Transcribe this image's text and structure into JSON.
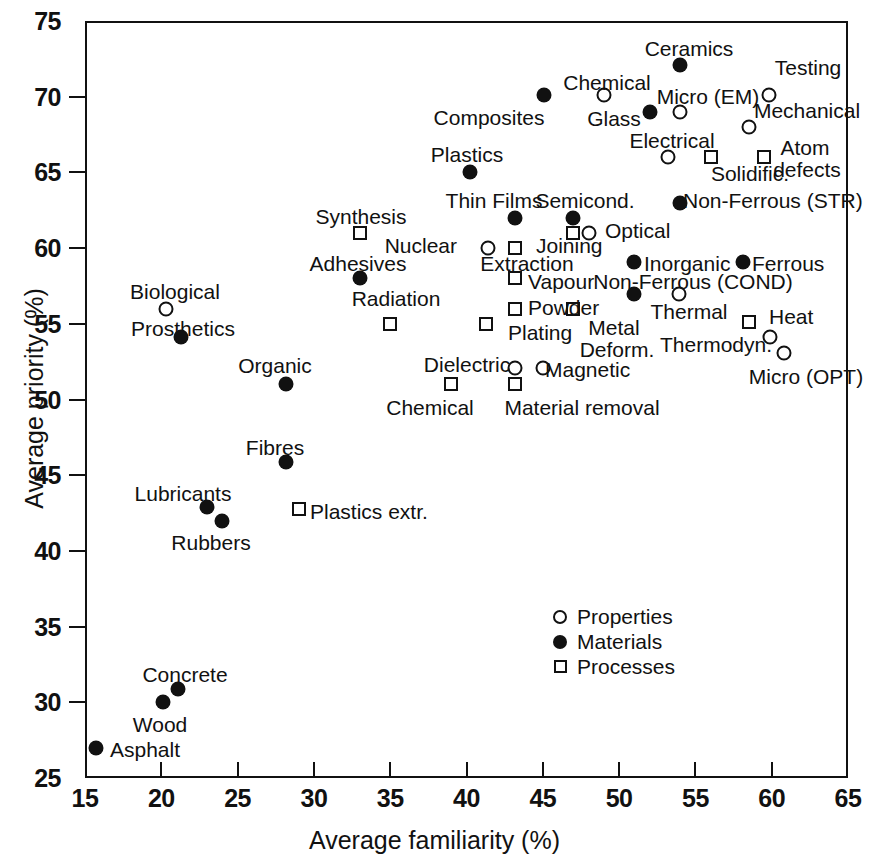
{
  "chart_data": {
    "type": "scatter",
    "title": "",
    "xlabel": "Average familiarity  (%)",
    "ylabel": "Average priority  (%)",
    "xlim": [
      15,
      65
    ],
    "ylim": [
      25,
      75
    ],
    "xticks": [
      15,
      20,
      25,
      30,
      35,
      40,
      45,
      50,
      55,
      60,
      65
    ],
    "yticks": [
      25,
      30,
      35,
      40,
      45,
      50,
      55,
      60,
      65,
      70,
      75
    ],
    "grid": false,
    "legend_position": "lower-center-right",
    "series": [
      {
        "name": "Properties",
        "marker": "open-circle",
        "points": [
          {
            "label": "Biological",
            "x": 20.3,
            "y": 56.0
          },
          {
            "label": "Chemical",
            "x": 49.0,
            "y": 70.1
          },
          {
            "label": "Micro (EM)",
            "x": 54.0,
            "y": 69.0
          },
          {
            "label": "Testing",
            "x": 59.8,
            "y": 70.1
          },
          {
            "label": "Mechanical",
            "x": 58.5,
            "y": 68.0
          },
          {
            "label": "Electrical",
            "x": 53.2,
            "y": 66.0
          },
          {
            "label": "Optical",
            "x": 48.0,
            "y": 61.0
          },
          {
            "label": "Nuclear",
            "x": 41.4,
            "y": 60.0
          },
          {
            "label": "Thermal",
            "x": 53.9,
            "y": 57.0
          },
          {
            "label": "Thermodyn.",
            "x": 59.9,
            "y": 54.1
          },
          {
            "label": "Micro (OPT)",
            "x": 60.8,
            "y": 53.1
          },
          {
            "label": "Dielectric",
            "x": 43.2,
            "y": 52.1
          },
          {
            "label": "Magnetic",
            "x": 45.0,
            "y": 52.1
          }
        ]
      },
      {
        "name": "Materials",
        "marker": "filled-circle",
        "points": [
          {
            "label": "Ceramics",
            "x": 54.0,
            "y": 72.1
          },
          {
            "label": "Composites",
            "x": 45.1,
            "y": 70.1
          },
          {
            "label": "Glass",
            "x": 52.0,
            "y": 69.0
          },
          {
            "label": "Plastics",
            "x": 40.2,
            "y": 65.0
          },
          {
            "label": "Non-Ferrous (STR)",
            "x": 54.0,
            "y": 63.0
          },
          {
            "label": "Thin Films",
            "x": 43.2,
            "y": 62.0
          },
          {
            "label": "Semicond.",
            "x": 47.0,
            "y": 62.0
          },
          {
            "label": "Inorganic",
            "x": 51.0,
            "y": 59.1
          },
          {
            "label": "Ferrous",
            "x": 58.1,
            "y": 59.1
          },
          {
            "label": "Adhesives",
            "x": 33.0,
            "y": 58.0
          },
          {
            "label": "Non-Ferrous (COND)",
            "x": 51.0,
            "y": 57.0
          },
          {
            "label": "Prosthetics",
            "x": 21.3,
            "y": 54.1
          },
          {
            "label": "Organic",
            "x": 28.2,
            "y": 51.0
          },
          {
            "label": "Fibres",
            "x": 28.2,
            "y": 45.9
          },
          {
            "label": "Lubricants",
            "x": 23.0,
            "y": 42.9
          },
          {
            "label": "Rubbers",
            "x": 24.0,
            "y": 42.0
          },
          {
            "label": "Concrete",
            "x": 21.1,
            "y": 30.9
          },
          {
            "label": "Wood",
            "x": 20.1,
            "y": 30.0
          },
          {
            "label": "Asphalt",
            "x": 15.7,
            "y": 27.0
          }
        ]
      },
      {
        "name": "Processes",
        "marker": "open-square",
        "points": [
          {
            "label": "Solidific.",
            "x": 56.0,
            "y": 66.0
          },
          {
            "label": "Atom defects",
            "x": 59.5,
            "y": 66.0
          },
          {
            "label": "Synthesis",
            "x": 33.0,
            "y": 61.0
          },
          {
            "label": "Joining",
            "x": 43.2,
            "y": 60.0
          },
          {
            "label": "Extraction",
            "x": 47.0,
            "y": 61.0
          },
          {
            "label": "Vapour",
            "x": 43.2,
            "y": 58.0
          },
          {
            "label": "Powder",
            "x": 43.2,
            "y": 56.0
          },
          {
            "label": "Metal Deform.",
            "x": 47.0,
            "y": 56.0
          },
          {
            "label": "Heat",
            "x": 58.5,
            "y": 55.1
          },
          {
            "label": "Radiation",
            "x": 35.0,
            "y": 55.0
          },
          {
            "label": "Plating",
            "x": 41.3,
            "y": 55.0
          },
          {
            "label": "Chemical",
            "x": 39.0,
            "y": 51.0
          },
          {
            "label": "Material removal",
            "x": 43.2,
            "y": 51.0
          },
          {
            "label": "Plastics extr.",
            "x": 29.0,
            "y": 42.8
          }
        ]
      }
    ],
    "legend_entries": [
      {
        "label": "Properties",
        "marker": "open-circle"
      },
      {
        "label": "Materials",
        "marker": "filled-circle"
      },
      {
        "label": "Processes",
        "marker": "open-square"
      }
    ]
  },
  "plot_labels": [
    {
      "text": "Ceramics",
      "px": 689,
      "py": 38,
      "anchor": "c"
    },
    {
      "text": "Testing",
      "px": 808,
      "py": 57,
      "anchor": "c"
    },
    {
      "text": "Chemical",
      "px": 607,
      "py": 72,
      "anchor": "c"
    },
    {
      "text": "Micro (EM)",
      "px": 708,
      "py": 86,
      "anchor": "c"
    },
    {
      "text": "Composites",
      "px": 489,
      "py": 107,
      "anchor": "c"
    },
    {
      "text": "Glass",
      "px": 614,
      "py": 108,
      "anchor": "c"
    },
    {
      "text": "Mechanical",
      "px": 807,
      "py": 100,
      "anchor": "c"
    },
    {
      "text": "Electrical",
      "px": 672,
      "py": 130,
      "anchor": "c"
    },
    {
      "text": "Atom",
      "px": 805,
      "py": 137,
      "anchor": "c"
    },
    {
      "text": "defects",
      "px": 807,
      "py": 159,
      "anchor": "c"
    },
    {
      "text": "Plastics",
      "px": 467,
      "py": 144,
      "anchor": "c"
    },
    {
      "text": "Solidific.",
      "px": 750,
      "py": 163,
      "anchor": "c"
    },
    {
      "text": "Thin Films",
      "px": 494,
      "py": 190,
      "anchor": "c"
    },
    {
      "text": "Semicond.",
      "px": 585,
      "py": 190,
      "anchor": "c"
    },
    {
      "text": "Non-Ferrous (STR)",
      "px": 683,
      "py": 190,
      "anchor": "l"
    },
    {
      "text": "Synthesis",
      "px": 361,
      "py": 206,
      "anchor": "c"
    },
    {
      "text": "Optical",
      "px": 605,
      "py": 220,
      "anchor": "l"
    },
    {
      "text": "Nuclear",
      "px": 457,
      "py": 235,
      "anchor": "r"
    },
    {
      "text": "Joining",
      "px": 536,
      "py": 235,
      "anchor": "l"
    },
    {
      "text": "Extraction",
      "px": 527,
      "py": 253,
      "anchor": "c"
    },
    {
      "text": "Adhesives",
      "px": 358,
      "py": 253,
      "anchor": "c"
    },
    {
      "text": "Inorganic",
      "px": 644,
      "py": 253,
      "anchor": "l"
    },
    {
      "text": "Ferrous",
      "px": 752,
      "py": 253,
      "anchor": "l"
    },
    {
      "text": "Non-Ferrous (COND)",
      "px": 693,
      "py": 271,
      "anchor": "c"
    },
    {
      "text": "Biological",
      "px": 175,
      "py": 281,
      "anchor": "c"
    },
    {
      "text": "Vapour",
      "px": 528,
      "py": 271,
      "anchor": "l"
    },
    {
      "text": "Radiation",
      "px": 396,
      "py": 288,
      "anchor": "c"
    },
    {
      "text": "Powder",
      "px": 528,
      "py": 297,
      "anchor": "l"
    },
    {
      "text": "Thermal",
      "px": 689,
      "py": 301,
      "anchor": "c"
    },
    {
      "text": "Heat",
      "px": 769,
      "py": 306,
      "anchor": "l"
    },
    {
      "text": "Prosthetics",
      "px": 183,
      "py": 318,
      "anchor": "c"
    },
    {
      "text": "Plating",
      "px": 508,
      "py": 322,
      "anchor": "l"
    },
    {
      "text": "Metal",
      "px": 614,
      "py": 317,
      "anchor": "c"
    },
    {
      "text": "Deform.",
      "px": 617,
      "py": 339,
      "anchor": "c"
    },
    {
      "text": "Thermodyn.",
      "px": 716,
      "py": 334,
      "anchor": "c"
    },
    {
      "text": "Organic",
      "px": 275,
      "py": 355,
      "anchor": "c"
    },
    {
      "text": "Dielectric",
      "px": 467,
      "py": 354,
      "anchor": "c"
    },
    {
      "text": "Magnetic",
      "px": 545,
      "py": 359,
      "anchor": "l"
    },
    {
      "text": "Micro (OPT)",
      "px": 806,
      "py": 366,
      "anchor": "c"
    },
    {
      "text": "Chemical",
      "px": 430,
      "py": 397,
      "anchor": "c"
    },
    {
      "text": "Material removal",
      "px": 582,
      "py": 397,
      "anchor": "c"
    },
    {
      "text": "Fibres",
      "px": 275,
      "py": 437,
      "anchor": "c"
    },
    {
      "text": "Lubricants",
      "px": 183,
      "py": 483,
      "anchor": "c"
    },
    {
      "text": "Plastics extr.",
      "px": 310,
      "py": 501,
      "anchor": "l"
    },
    {
      "text": "Rubbers",
      "px": 211,
      "py": 532,
      "anchor": "c"
    },
    {
      "text": "Concrete",
      "px": 185,
      "py": 664,
      "anchor": "c"
    },
    {
      "text": "Wood",
      "px": 160,
      "py": 714,
      "anchor": "c"
    },
    {
      "text": "Asphalt",
      "px": 110,
      "py": 739,
      "anchor": "l"
    }
  ]
}
